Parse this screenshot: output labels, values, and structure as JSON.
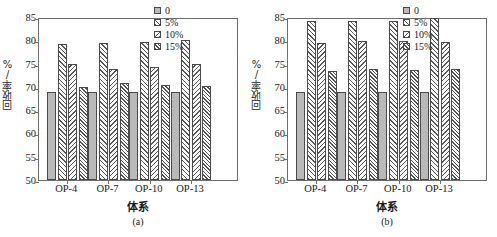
{
  "figure": {
    "panels": [
      {
        "caption": "(a)",
        "chart_data": {
          "type": "bar",
          "title": "",
          "xlabel": "体系",
          "ylabel": "回收率/%",
          "ylim": [
            50,
            85
          ],
          "yticks": [
            85,
            80,
            75,
            70,
            65,
            60,
            55,
            50
          ],
          "grid": false,
          "legend_position": "top-right",
          "categories": [
            "OP-4",
            "OP-7",
            "OP-10",
            "OP-13"
          ],
          "series": [
            {
              "name": "0",
              "values": [
                68.9,
                68.9,
                69.0,
                69.0
              ]
            },
            {
              "name": "5%",
              "values": [
                79.2,
                79.4,
                79.7,
                80.1
              ]
            },
            {
              "name": "10%",
              "values": [
                74.9,
                73.9,
                74.2,
                74.9
              ]
            },
            {
              "name": "15%",
              "values": [
                70.0,
                70.9,
                70.5,
                70.1
              ]
            }
          ]
        }
      },
      {
        "caption": "(b)",
        "chart_data": {
          "type": "bar",
          "title": "",
          "xlabel": "体系",
          "ylabel": "回收率/%",
          "ylim": [
            50,
            85
          ],
          "yticks": [
            85,
            80,
            75,
            70,
            65,
            60,
            55,
            50
          ],
          "grid": false,
          "legend_position": "top-right",
          "categories": [
            "OP-4",
            "OP-7",
            "OP-10",
            "OP-13"
          ],
          "series": [
            {
              "name": "0",
              "values": [
                68.9,
                68.9,
                68.9,
                69.0
              ]
            },
            {
              "name": "5%",
              "values": [
                84.2,
                84.1,
                84.2,
                84.7
              ]
            },
            {
              "name": "10%",
              "values": [
                79.5,
                79.8,
                79.8,
                79.7
              ]
            },
            {
              "name": "15%",
              "values": [
                73.4,
                73.8,
                73.7,
                73.8
              ]
            }
          ]
        }
      }
    ],
    "colors": {
      "series_0_fill": "#b9b9b9",
      "hatch": "#555555",
      "axis": "#6e6e6e",
      "text": "#1a1a1a",
      "background": "#ffffff"
    }
  }
}
